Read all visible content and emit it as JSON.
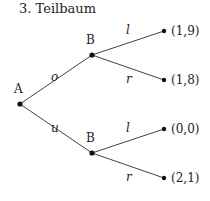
{
  "title": "3. Teilbaum",
  "nodes": {
    "root": {
      "label": "A"
    },
    "upper": {
      "label": "B"
    },
    "lower": {
      "label": "B"
    }
  },
  "edges": {
    "o": "o",
    "u": "u",
    "upper_l": "l",
    "upper_r": "r",
    "lower_l": "l",
    "lower_r": "r"
  },
  "payoffs": [
    "(1,9)",
    "(1,8)",
    "(0,0)",
    "(2,1)"
  ]
}
